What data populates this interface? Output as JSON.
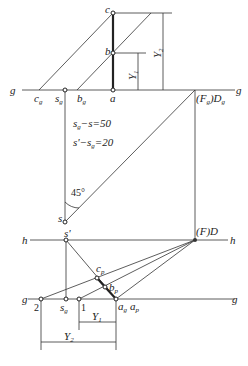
{
  "diagram": {
    "type": "descriptive-geometry-perspective-construction",
    "labels": {
      "g_left_top": "g",
      "g_right_top": "g",
      "c": "c",
      "b": "b",
      "a": "a",
      "c_g": "c",
      "c_g_sub": "g",
      "s_g_top": "s",
      "s_g_top_sub": "g",
      "b_g": "b",
      "b_g_sub": "g",
      "Fg_Dg": "(F",
      "Fg_Dg_sub1": "g",
      "Fg_Dg_mid": ")D",
      "Fg_Dg_sub2": "g",
      "Y1_top": "Y",
      "Y1_top_sub": "1",
      "Y2_top": "Y",
      "Y2_top_sub": "2",
      "eq1": "s",
      "eq1_sub": "g",
      "eq1_rest": "−s=50",
      "eq2": "s'−s",
      "eq2_sub": "g",
      "eq2_rest": "=20",
      "angle": "45°",
      "s": "s",
      "s_prime": "s'",
      "h_left": "h",
      "h_right": "h",
      "FD": "(F)D",
      "c_p": "c",
      "c_p_sub": "p",
      "b_p": "b",
      "b_p_sub": "p",
      "g_left_bottom": "g",
      "g_right_bottom": "g",
      "pt2": "2",
      "s_g_bottom": "s",
      "s_g_bottom_sub": "g",
      "pt1": "1",
      "a_g": "a",
      "a_g_sub": "g",
      "a_p": "a",
      "a_p_sub": "p",
      "Y1_bottom": "Y",
      "Y1_bottom_sub": "1",
      "Y2_bottom": "Y",
      "Y2_bottom_sub": "2"
    }
  }
}
